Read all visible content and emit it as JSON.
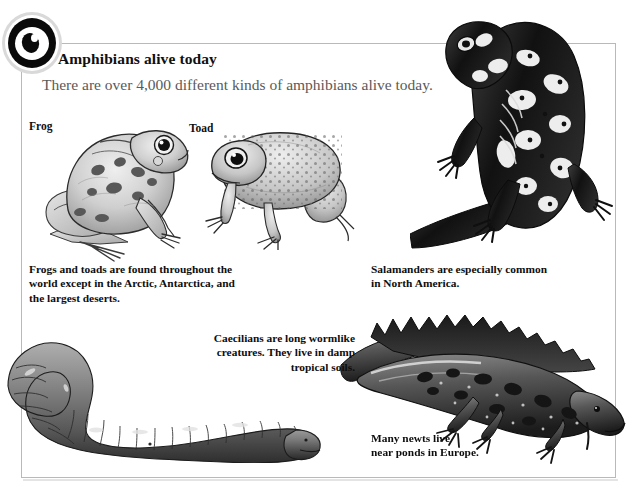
{
  "page": {
    "background_color": "#ffffff",
    "frame_color": "#b9b9b9"
  },
  "logo": {
    "name": "eye-logo",
    "icon": "eye-icon"
  },
  "header": {
    "title": "Amphibians alive today",
    "subtitle": "There are over 4,000 different kinds of amphibians alive today.",
    "title_color": "#101010",
    "subtitle_color": "#5a5a5a"
  },
  "labels": {
    "frog": "Frog",
    "toad": "Toad"
  },
  "captions": {
    "frogs_and_toads": "Frogs and toads are found throughout the\nworld except in the Arctic, Antarctica, and\nthe largest deserts.",
    "salamanders": "Salamanders are especially common\nin North America.",
    "caecilians": "Caecilians are long wormlike\ncreatures. They live in damp\ntropical soils.",
    "newts": "Many newts live\nnear ponds in Europe."
  },
  "illustrations": [
    {
      "name": "frog-illustration",
      "subject": "frog",
      "alt": "Side view of a spotted frog sitting"
    },
    {
      "name": "toad-illustration",
      "subject": "toad",
      "alt": "Warty toad facing left"
    },
    {
      "name": "salamander-illustration",
      "subject": "salamander",
      "alt": "Dark spotted salamander climbing upward"
    },
    {
      "name": "caecilian-illustration",
      "subject": "caecilian",
      "alt": "Long segmented wormlike caecilian"
    },
    {
      "name": "newt-illustration",
      "subject": "newt",
      "alt": "Crested newt with spiky dorsal crest"
    }
  ]
}
